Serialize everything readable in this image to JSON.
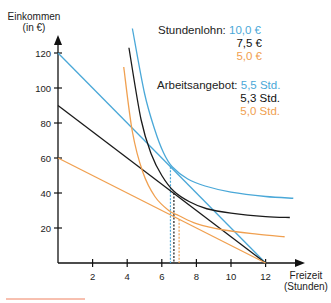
{
  "chart_data": {
    "type": "line",
    "title": "",
    "xlabel": "Freizeit (Stunden)",
    "ylabel": "Einkommen (in €)",
    "xlabel_lines": [
      "Freizeit",
      "(Stunden)"
    ],
    "ylabel_lines": [
      "Einkommen",
      "(in €)"
    ],
    "xlim": [
      0,
      13.5
    ],
    "ylim": [
      0,
      130
    ],
    "x_ticks": [
      2,
      4,
      6,
      8,
      10,
      12
    ],
    "y_ticks": [
      20,
      40,
      60,
      80,
      100,
      120
    ],
    "grid": false,
    "colors": {
      "blue": "#4aa8d8",
      "black": "#1a1a1a",
      "orange": "#f0a050",
      "accent_line": "#f08060"
    },
    "budget_lines": [
      {
        "name": "Stundenlohn 10,0 €",
        "color": "#4aa8d8",
        "x": [
          0,
          12
        ],
        "y": [
          120,
          0
        ]
      },
      {
        "name": "Stundenlohn 7,5 €",
        "color": "#1a1a1a",
        "x": [
          0,
          12
        ],
        "y": [
          90,
          0
        ]
      },
      {
        "name": "Stundenlohn 5,0 €",
        "color": "#f0a050",
        "x": [
          0,
          12
        ],
        "y": [
          60,
          0
        ]
      }
    ],
    "indifference_curves": [
      {
        "name": "IK blau",
        "color": "#4aa8d8",
        "x": [
          4.3,
          5.0,
          5.6,
          6.1,
          6.6,
          7.5,
          8.5,
          10.0,
          12.0,
          13.6
        ],
        "y": [
          134,
          97,
          76,
          63,
          55,
          48,
          44,
          40.5,
          38,
          37
        ]
      },
      {
        "name": "IK schwarz",
        "color": "#1a1a1a",
        "x": [
          4.1,
          4.8,
          5.4,
          6.0,
          6.7,
          7.6,
          8.6,
          10.0,
          12.0,
          13.4
        ],
        "y": [
          123,
          82,
          62,
          50,
          41,
          35,
          31,
          28.5,
          26.5,
          26
        ]
      },
      {
        "name": "IK orange",
        "color": "#f0a050",
        "x": [
          3.8,
          4.3,
          4.9,
          5.6,
          6.4,
          7.0,
          8.0,
          9.5,
          11.5,
          13.1
        ],
        "y": [
          112,
          75,
          52,
          38,
          30,
          27,
          22.5,
          19,
          16.5,
          15
        ]
      }
    ],
    "optima": [
      {
        "color": "#4aa8d8",
        "x": 6.5,
        "y": 55,
        "arbeitsangebot": "5,5 Std."
      },
      {
        "color": "#1a1a1a",
        "x": 6.7,
        "y": 40,
        "arbeitsangebot": "5,3 Std."
      },
      {
        "color": "#f0a050",
        "x": 7.0,
        "y": 25,
        "arbeitsangebot": "5,0 Std."
      }
    ],
    "legend": {
      "stundenlohn_label": "Stundenlohn:",
      "stundenlohn_values": [
        "10,0 €",
        "7,5 €",
        "5,0 €"
      ],
      "arbeitsangebot_label": "Arbeitsangebot:",
      "arbeitsangebot_values": [
        "5,5 Std.",
        "5,3 Std.",
        "5,0 Std."
      ],
      "position": "top-right"
    }
  }
}
